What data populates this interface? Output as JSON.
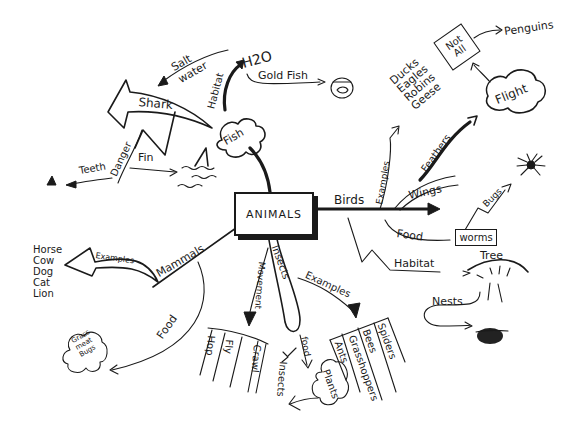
{
  "diagram": {
    "type": "concept-map",
    "center": {
      "label": "ANIMALS"
    },
    "fish": {
      "node": "Fish",
      "habitat_label": "Habitat",
      "habitat_value": "H2O",
      "salt_water": [
        "Salt",
        "water"
      ],
      "gold_fish": "Gold Fish",
      "shark": "Shark",
      "danger": "Danger",
      "fin": "Fin",
      "teeth": "Teeth"
    },
    "birds": {
      "node": "Birds",
      "examples_label": "Examples",
      "examples": [
        "Ducks",
        "Eagles",
        "Robins",
        "Geese"
      ],
      "feathers": "Feathers",
      "wings": "Wings",
      "flight": "Flight",
      "not_all": [
        "Not",
        "All"
      ],
      "penguins": "Penguins",
      "food_label": "Food",
      "worms": "worms",
      "bugs": "Bugs",
      "habitat_label": "Habitat",
      "tree": "Tree",
      "nests": "Nests"
    },
    "mammals": {
      "node": "Mammals",
      "examples_label": "Examples",
      "examples": [
        "Horse",
        "Cow",
        "Dog",
        "Cat",
        "Lion"
      ],
      "food_label": "Food",
      "food_items": [
        "Grass",
        "meat",
        "Bugs"
      ]
    },
    "insects": {
      "node": "Insects",
      "movement_label": "Movement",
      "movement": [
        "Hop",
        "Fly",
        "Crawl"
      ],
      "examples_label": "Examples",
      "examples": [
        "Spiders",
        "Bees",
        "Grasshoppers",
        "Ants"
      ],
      "food_label": "food",
      "food_items": [
        "Plants",
        "Insects"
      ]
    }
  }
}
